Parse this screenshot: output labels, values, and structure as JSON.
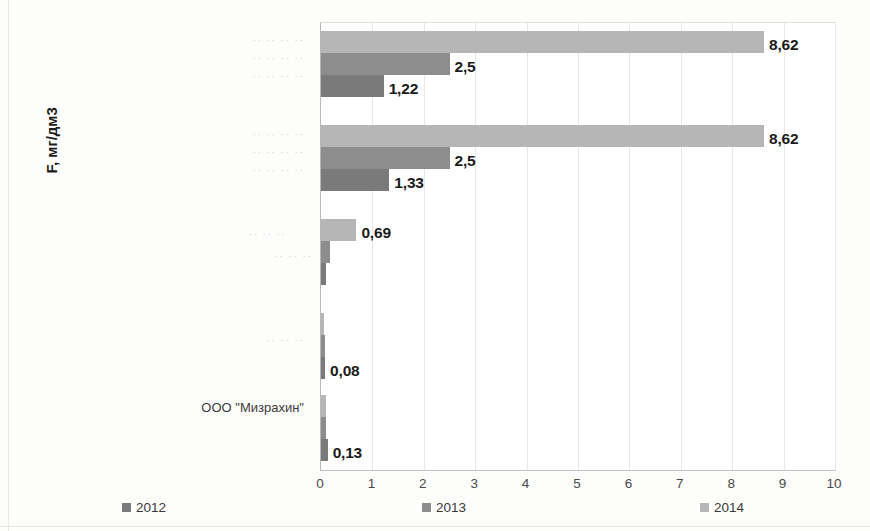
{
  "chart_data": {
    "type": "bar",
    "orientation": "horizontal",
    "title": "",
    "xlabel": "",
    "ylabel": "F, мг/дм3",
    "xlim": [
      0,
      10
    ],
    "xticks": [
      "0",
      "1",
      "2",
      "3",
      "4",
      "5",
      "6",
      "7",
      "8",
      "9",
      "10"
    ],
    "grid": true,
    "legend_position": "bottom",
    "categories": [
      "",
      "",
      "",
      "",
      "ООО \"Мизрахин\""
    ],
    "category_display": [
      "·· ·· ·· ··",
      "·· ·· ·· ··",
      "·· ·· ··",
      "·· ·· ··",
      "ООО \"Мизрахин\""
    ],
    "series": [
      {
        "name": "2012",
        "color": "#7a7a7a",
        "values": [
          1.22,
          1.33,
          0.09,
          0.08,
          0.13
        ],
        "labels": [
          "1,22",
          "1,33",
          "",
          "0,08",
          "0,13"
        ]
      },
      {
        "name": "2013",
        "color": "#8d8d8d",
        "values": [
          2.5,
          2.5,
          0.17,
          0.07,
          0.1
        ],
        "labels": [
          "2,5",
          "2,5",
          "",
          "",
          ""
        ]
      },
      {
        "name": "2014",
        "color": "#b6b6b6",
        "values": [
          8.62,
          8.62,
          0.69,
          0.06,
          0.09
        ],
        "labels": [
          "8,62",
          "8,62",
          "0,69",
          "",
          ""
        ]
      }
    ]
  },
  "legend": {
    "items": [
      {
        "label": "2012",
        "key": "s2012"
      },
      {
        "label": "2013",
        "key": "s2013"
      },
      {
        "label": "2014",
        "key": "s2014"
      }
    ]
  },
  "axis": {
    "y_title": "F, мг/дм3"
  }
}
